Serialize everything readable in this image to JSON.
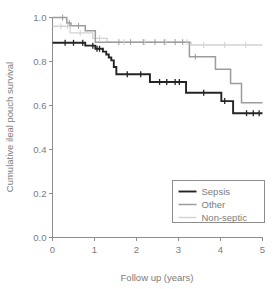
{
  "chart_data": {
    "type": "line",
    "title": "",
    "subtitle": "",
    "xlabel": "Follow up (years)",
    "ylabel": "Cumulative ileal pouch survival",
    "xlim": [
      0,
      5
    ],
    "ylim": [
      0.0,
      1.0
    ],
    "xticks": [
      0,
      1,
      2,
      3,
      4,
      5
    ],
    "xtick_labels": [
      "0",
      "1",
      "2",
      "3",
      "4",
      "5"
    ],
    "yticks": [
      0.0,
      0.2,
      0.4,
      0.6,
      0.8,
      1.0
    ],
    "ytick_labels": [
      "0.0",
      "0.2",
      "0.4",
      "0.6",
      "0.8",
      "1.0"
    ],
    "grid": false,
    "step_type": "post",
    "legend_position": "lower right",
    "annotations": [],
    "series": [
      {
        "name": "Sepsis",
        "color": "#242424",
        "width": 1.9,
        "points": [
          [
            0.0,
            0.885
          ],
          [
            0.06,
            0.885
          ],
          [
            0.78,
            0.885
          ],
          [
            0.78,
            0.872
          ],
          [
            1.02,
            0.872
          ],
          [
            1.02,
            0.858
          ],
          [
            1.2,
            0.858
          ],
          [
            1.2,
            0.845
          ],
          [
            1.28,
            0.845
          ],
          [
            1.28,
            0.832
          ],
          [
            1.34,
            0.832
          ],
          [
            1.34,
            0.818
          ],
          [
            1.4,
            0.818
          ],
          [
            1.4,
            0.805
          ],
          [
            1.46,
            0.805
          ],
          [
            1.46,
            0.775
          ],
          [
            1.52,
            0.775
          ],
          [
            1.52,
            0.742
          ],
          [
            2.32,
            0.742
          ],
          [
            2.32,
            0.707
          ],
          [
            3.18,
            0.707
          ],
          [
            3.18,
            0.658
          ],
          [
            4.02,
            0.658
          ],
          [
            4.02,
            0.62
          ],
          [
            4.3,
            0.62
          ],
          [
            4.3,
            0.565
          ],
          [
            5.0,
            0.565
          ]
        ],
        "censor_times": [
          0.3,
          0.5,
          0.72,
          0.96,
          1.06,
          1.12,
          1.78,
          2.1,
          2.55,
          2.72,
          2.92,
          3.02,
          3.6,
          4.1,
          4.62,
          4.78,
          4.92
        ]
      },
      {
        "name": "Other",
        "color": "#9c9c9c",
        "width": 1.5,
        "points": [
          [
            0.0,
            1.0
          ],
          [
            0.34,
            1.0
          ],
          [
            0.34,
            0.975
          ],
          [
            0.44,
            0.975
          ],
          [
            0.44,
            0.962
          ],
          [
            0.78,
            0.962
          ],
          [
            0.78,
            0.94
          ],
          [
            1.02,
            0.94
          ],
          [
            1.02,
            0.888
          ],
          [
            3.26,
            0.888
          ],
          [
            3.26,
            0.822
          ],
          [
            3.88,
            0.822
          ],
          [
            3.88,
            0.765
          ],
          [
            4.24,
            0.765
          ],
          [
            4.24,
            0.7
          ],
          [
            4.5,
            0.7
          ],
          [
            4.5,
            0.613
          ],
          [
            5.0,
            0.613
          ]
        ],
        "censor_times": [
          0.24,
          0.4,
          0.62,
          1.58,
          1.86,
          2.16,
          2.44,
          2.66,
          2.92,
          3.1,
          3.4
        ]
      },
      {
        "name": "Non-septic",
        "color": "#d2d2d2",
        "width": 1.4,
        "points": [
          [
            0.0,
            0.96
          ],
          [
            0.42,
            0.96
          ],
          [
            0.42,
            0.93
          ],
          [
            0.96,
            0.93
          ],
          [
            0.96,
            0.905
          ],
          [
            1.3,
            0.905
          ],
          [
            1.3,
            0.888
          ],
          [
            3.3,
            0.888
          ],
          [
            3.3,
            0.875
          ],
          [
            5.0,
            0.875
          ]
        ],
        "censor_times": [
          0.2,
          0.36,
          0.66,
          1.12,
          1.7,
          2.2,
          2.7,
          3.2,
          3.6,
          4.1,
          4.6
        ]
      }
    ]
  },
  "legend": {
    "entries": [
      {
        "label": "Sepsis"
      },
      {
        "label": "Other"
      },
      {
        "label": "Non-septic"
      }
    ]
  },
  "axes": {
    "x_title": "Follow up (years)",
    "y_title": "Cumulative ileal pouch survival"
  }
}
